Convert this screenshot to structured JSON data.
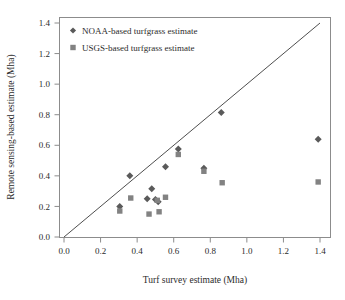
{
  "chart_data": {
    "type": "scatter",
    "title": "",
    "xlabel": "Turf survey estimate (Mha)",
    "ylabel": "Remote sensing-based estimate (Mha)",
    "xlim": [
      0.0,
      1.45
    ],
    "ylim": [
      0.0,
      1.45
    ],
    "xticks": [
      "0.0",
      "0.2",
      "0.4",
      "0.6",
      "0.8",
      "1.0",
      "1.2",
      "1.4"
    ],
    "xtick_values": [
      0.0,
      0.2,
      0.4,
      0.6,
      0.8,
      1.0,
      1.2,
      1.4
    ],
    "yticks": [
      "0.0",
      "0.2",
      "0.4",
      "0.6",
      "0.8",
      "1.0",
      "1.2",
      "1.4"
    ],
    "ytick_values": [
      0.0,
      0.2,
      0.4,
      0.6,
      0.8,
      1.0,
      1.2,
      1.4
    ],
    "grid": false,
    "legend_position": "top-left",
    "annotations": [
      {
        "name": "one-to-one-line",
        "type": "line",
        "from": [
          0.0,
          0.0
        ],
        "to": [
          1.4,
          1.4
        ]
      }
    ],
    "series": [
      {
        "name": "NOAA-based turfgrass estimate",
        "marker": "diamond",
        "color": "#5a5a5a",
        "points": [
          {
            "x": 0.305,
            "y": 0.2
          },
          {
            "x": 0.36,
            "y": 0.4
          },
          {
            "x": 0.455,
            "y": 0.25
          },
          {
            "x": 0.48,
            "y": 0.315
          },
          {
            "x": 0.5,
            "y": 0.245
          },
          {
            "x": 0.515,
            "y": 0.23
          },
          {
            "x": 0.555,
            "y": 0.46
          },
          {
            "x": 0.625,
            "y": 0.575
          },
          {
            "x": 0.765,
            "y": 0.45
          },
          {
            "x": 0.86,
            "y": 0.815
          },
          {
            "x": 1.39,
            "y": 0.64
          }
        ]
      },
      {
        "name": "USGS-based turfgrass estimate",
        "marker": "square",
        "color": "#828282",
        "points": [
          {
            "x": 0.305,
            "y": 0.17
          },
          {
            "x": 0.365,
            "y": 0.255
          },
          {
            "x": 0.465,
            "y": 0.15
          },
          {
            "x": 0.51,
            "y": 0.24
          },
          {
            "x": 0.52,
            "y": 0.165
          },
          {
            "x": 0.555,
            "y": 0.26
          },
          {
            "x": 0.625,
            "y": 0.54
          },
          {
            "x": 0.765,
            "y": 0.43
          },
          {
            "x": 0.865,
            "y": 0.355
          },
          {
            "x": 1.39,
            "y": 0.36
          }
        ]
      }
    ]
  },
  "legend": {
    "items": [
      {
        "label": "NOAA-based turfgrass estimate",
        "marker": "diamond",
        "color": "#5a5a5a"
      },
      {
        "label": "USGS-based turfgrass estimate",
        "marker": "square",
        "color": "#828282"
      }
    ]
  },
  "colors": {
    "noaa_marker": "#5a5a5a",
    "usgs_marker": "#828282",
    "frame": "#8c8c8c",
    "reference_line": "#3a3a3a",
    "text": "#2b2b2b",
    "background": "#ffffff"
  }
}
